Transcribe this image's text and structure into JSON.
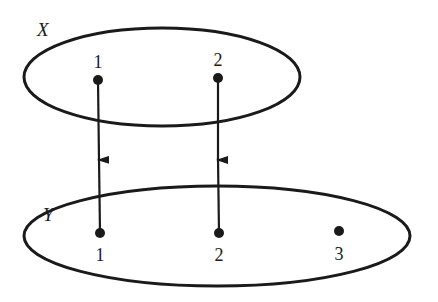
{
  "diagram": {
    "type": "function-mapping",
    "sets": [
      {
        "id": "X",
        "label": "X",
        "elements": [
          {
            "id": "x1",
            "label": "1"
          },
          {
            "id": "x2",
            "label": "2"
          }
        ]
      },
      {
        "id": "Y",
        "label": "Y",
        "elements": [
          {
            "id": "y1",
            "label": "1"
          },
          {
            "id": "y2",
            "label": "2"
          },
          {
            "id": "y3",
            "label": "3"
          }
        ]
      }
    ],
    "mappings": [
      {
        "from": "X.1",
        "to": "Y.1"
      },
      {
        "from": "X.2",
        "to": "Y.2"
      }
    ],
    "colors": {
      "stroke": "#1a1a1a",
      "background": "#ffffff"
    }
  }
}
